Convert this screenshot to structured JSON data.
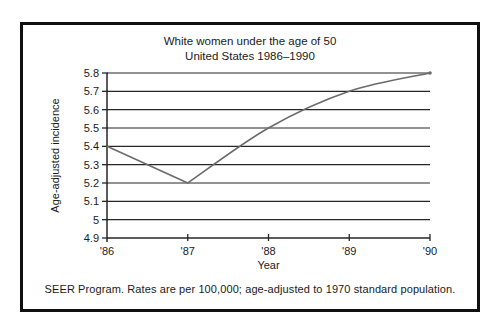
{
  "figure": {
    "title_line1": "White women under the age of 50",
    "title_line2": "United States 1986–1990",
    "footer": "SEER Program. Rates are per 100,000; age-adjusted to 1970 standard population."
  },
  "chart_data": {
    "type": "line",
    "title": "White women under the age of 50",
    "subtitle": "United States 1986–1990",
    "categories": [
      "'86",
      "'87",
      "'88",
      "'89",
      "'90"
    ],
    "values": [
      5.4,
      5.2,
      5.5,
      5.7,
      5.8
    ],
    "xlabel": "Year",
    "ylabel": "Age-adjusted incidence",
    "ylim": [
      4.9,
      5.8
    ],
    "yticks": [
      "4.9",
      "5",
      "5.1",
      "5.2",
      "5.3",
      "5.4",
      "5.5",
      "5.6",
      "5.7",
      "5.8"
    ],
    "grid": true,
    "legend": "none",
    "line_color": "#6b6b6b",
    "axis_color": "#262626",
    "text_color": "#1a1a1a"
  }
}
